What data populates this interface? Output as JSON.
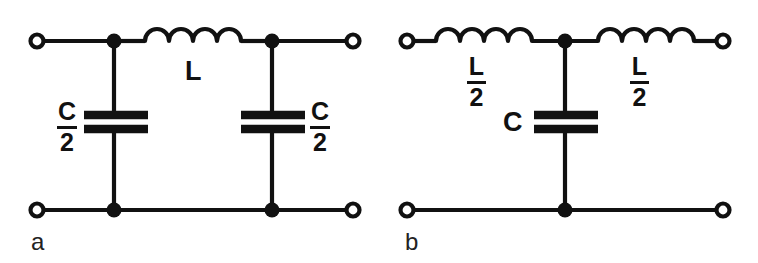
{
  "figure": {
    "type": "schematic-diagram",
    "background_color": "#ffffff",
    "line_color": "#111111",
    "width": 758,
    "height": 263
  },
  "panels": [
    {
      "id": "a",
      "letter": "a",
      "topology": "pi-section",
      "components": [
        {
          "ref": "L1",
          "type": "inductor",
          "label": "L",
          "label_kind": "plain",
          "orientation": "horizontal",
          "humps": 4
        },
        {
          "ref": "C1",
          "type": "capacitor",
          "label_numerator": "C",
          "label_denominator": "2",
          "label_kind": "fraction",
          "orientation": "vertical",
          "label_side": "left"
        },
        {
          "ref": "C2",
          "type": "capacitor",
          "label_numerator": "C",
          "label_denominator": "2",
          "label_kind": "fraction",
          "orientation": "vertical",
          "label_side": "right"
        }
      ],
      "terminals": 4,
      "junction_nodes": 4
    },
    {
      "id": "b",
      "letter": "b",
      "topology": "t-section",
      "components": [
        {
          "ref": "L1",
          "type": "inductor",
          "label_numerator": "L",
          "label_denominator": "2",
          "label_kind": "fraction",
          "orientation": "horizontal",
          "humps": 4
        },
        {
          "ref": "L2",
          "type": "inductor",
          "label_numerator": "L",
          "label_denominator": "2",
          "label_kind": "fraction",
          "orientation": "horizontal",
          "humps": 4
        },
        {
          "ref": "C1",
          "type": "capacitor",
          "label": "C",
          "label_kind": "plain",
          "orientation": "vertical",
          "label_side": "left"
        }
      ],
      "terminals": 4,
      "junction_nodes": 2
    }
  ],
  "labels": {
    "panel_a": {
      "inductor_L": "L",
      "cap_left_num": "C",
      "cap_left_den": "2",
      "cap_right_num": "C",
      "cap_right_den": "2",
      "letter": "a"
    },
    "panel_b": {
      "ind_left_num": "L",
      "ind_left_den": "2",
      "ind_right_num": "L",
      "ind_right_den": "2",
      "capacitor_C": "C",
      "letter": "b"
    }
  }
}
